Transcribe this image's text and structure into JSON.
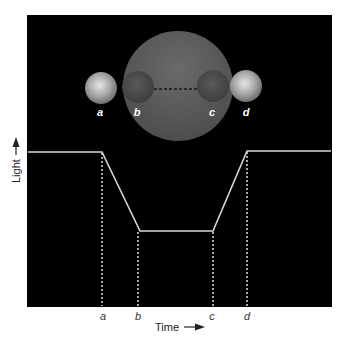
{
  "diagram": {
    "colors": {
      "background": "#ffffff",
      "panel": "#000000",
      "curve": "#d8d8d8",
      "guide": "#e0e0e0",
      "large_sphere": "#5a5a5a",
      "small_sphere_outside": "#b5b5b5",
      "small_sphere_inside": "#4a4a4a"
    },
    "spheres": {
      "large": {
        "cx": 178,
        "cy": 86,
        "r": 55
      },
      "positions": [
        {
          "id": "a",
          "label": "a",
          "cx": 101,
          "cy": 88,
          "r": 16,
          "state": "outside"
        },
        {
          "id": "b",
          "label": "b",
          "cx": 138,
          "cy": 87,
          "r": 16,
          "state": "inside"
        },
        {
          "id": "c",
          "label": "c",
          "cx": 213,
          "cy": 86,
          "r": 16,
          "state": "inside"
        },
        {
          "id": "d",
          "label": "d",
          "cx": 246,
          "cy": 86,
          "r": 16,
          "state": "outside"
        }
      ],
      "path_dashed": {
        "x1": 154,
        "x2": 197,
        "y": 89
      }
    },
    "curve": {
      "points": [
        [
          28,
          152
        ],
        [
          102,
          152
        ],
        [
          140,
          231
        ],
        [
          213,
          231
        ],
        [
          247,
          151
        ],
        [
          331,
          151
        ]
      ]
    },
    "guides": [
      {
        "id": "a",
        "x": 102,
        "y1": 152,
        "y2": 306
      },
      {
        "id": "b",
        "x": 138,
        "y1": 231,
        "y2": 306
      },
      {
        "id": "c",
        "x": 213,
        "y1": 231,
        "y2": 306
      },
      {
        "id": "d",
        "x": 247,
        "y1": 151,
        "y2": 306
      }
    ],
    "x_axis": {
      "title": "Time",
      "tick_labels": [
        {
          "label": "a",
          "x": 103
        },
        {
          "label": "b",
          "x": 138
        },
        {
          "label": "c",
          "x": 212
        },
        {
          "label": "d",
          "x": 247
        }
      ]
    },
    "y_axis": {
      "title": "Light"
    }
  }
}
